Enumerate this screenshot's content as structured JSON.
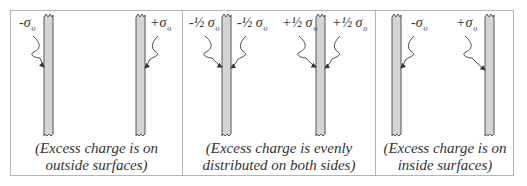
{
  "figure": {
    "panels": [
      {
        "id": "outside",
        "labels": [
          {
            "sign": "-",
            "fraction": "",
            "symbol": "σ",
            "sub": "o"
          },
          {
            "sign": "+",
            "fraction": "",
            "symbol": "σ",
            "sub": "o"
          }
        ],
        "caption_line1": "(Excess charge is on",
        "caption_line2": "outside surfaces)"
      },
      {
        "id": "evenly",
        "labels": [
          {
            "sign": "-",
            "fraction": "½ ",
            "symbol": "σ",
            "sub": "o"
          },
          {
            "sign": "-",
            "fraction": "½ ",
            "symbol": "σ",
            "sub": "o"
          },
          {
            "sign": "+",
            "fraction": "½ ",
            "symbol": "σ",
            "sub": "o"
          },
          {
            "sign": "+",
            "fraction": "½ ",
            "symbol": "σ",
            "sub": "o"
          }
        ],
        "caption_line1": "(Excess charge is evenly",
        "caption_line2": "distributed on both sides)"
      },
      {
        "id": "inside",
        "labels": [
          {
            "sign": "-",
            "fraction": "",
            "symbol": "σ",
            "sub": "o"
          },
          {
            "sign": "+",
            "fraction": "",
            "symbol": "σ",
            "sub": "o"
          }
        ],
        "caption_line1": "(Excess charge is on",
        "caption_line2": "inside surfaces)"
      }
    ],
    "colors": {
      "plate_fill": "#d4d4d4",
      "plate_stroke": "#555555",
      "border": "#b4b4b4",
      "text": "#333333"
    }
  }
}
